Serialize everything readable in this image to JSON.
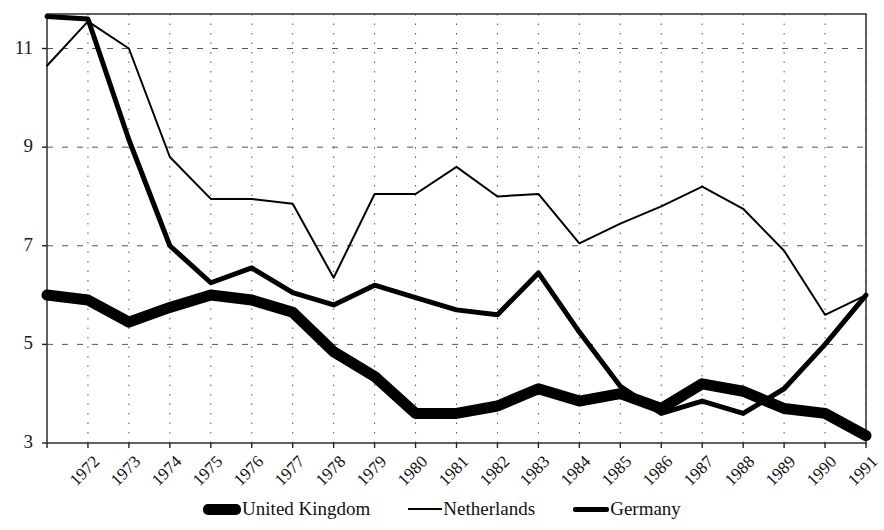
{
  "chart_data": {
    "type": "line",
    "title": "",
    "xlabel": "",
    "ylabel": "",
    "grid": true,
    "legend_position": "bottom",
    "xlim": [
      1972,
      1992
    ],
    "ylim": [
      3,
      11.7
    ],
    "ytick_labels": [
      "11",
      "9",
      "7",
      "5",
      "3"
    ],
    "ytick_values": [
      11,
      9,
      7,
      5,
      3
    ],
    "x": [
      1972,
      1973,
      1974,
      1975,
      1976,
      1977,
      1978,
      1979,
      1980,
      1981,
      1982,
      1983,
      1984,
      1985,
      1986,
      1987,
      1988,
      1989,
      1990,
      1991,
      1992
    ],
    "categories": [
      "1972",
      "1973",
      "1974",
      "1975",
      "1976",
      "1977",
      "1978",
      "1979",
      "1980",
      "1981",
      "1982",
      "1983",
      "1984",
      "1985",
      "1986",
      "1987",
      "1988",
      "1989",
      "1990",
      "1991",
      "1992"
    ],
    "series": [
      {
        "name": "United Kingdom",
        "style": "very-thick",
        "width": 11,
        "color": "#000000",
        "values": [
          6.0,
          5.9,
          5.45,
          5.75,
          6.0,
          5.9,
          5.65,
          4.85,
          4.35,
          3.6,
          3.6,
          3.75,
          4.1,
          3.85,
          4.0,
          3.7,
          4.2,
          4.05,
          3.7,
          3.6,
          3.15
        ]
      },
      {
        "name": "Netherlands",
        "style": "thin",
        "width": 2,
        "color": "#000000",
        "values": [
          10.65,
          11.55,
          11.0,
          8.8,
          7.95,
          7.95,
          7.85,
          6.35,
          8.05,
          8.05,
          8.6,
          8.0,
          8.05,
          7.05,
          7.45,
          7.8,
          8.2,
          7.75,
          6.9,
          5.6,
          6.0
        ]
      },
      {
        "name": "Germany",
        "style": "medium-thick",
        "width": 5,
        "color": "#000000",
        "values": [
          11.65,
          11.6,
          9.15,
          7.0,
          6.25,
          6.55,
          6.05,
          5.8,
          6.2,
          5.95,
          5.7,
          5.6,
          6.45,
          5.25,
          4.15,
          3.6,
          3.85,
          3.6,
          4.1,
          5.0,
          6.0
        ]
      }
    ]
  },
  "legend": {
    "items": [
      {
        "label": "United Kingdom",
        "swatch": "legend-swatch-thick"
      },
      {
        "label": "Netherlands",
        "swatch": "legend-swatch-thin"
      },
      {
        "label": "Germany",
        "swatch": "legend-swatch-medium"
      }
    ]
  }
}
